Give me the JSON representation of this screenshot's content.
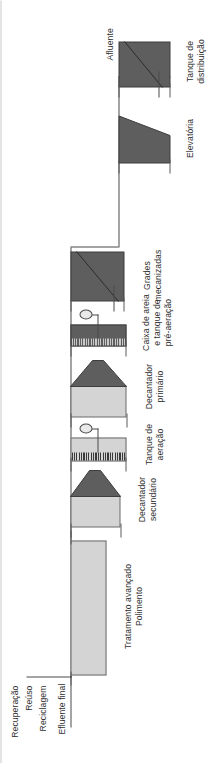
{
  "figure": {
    "kind": "wastewater-treatment-plant-flow-diagram",
    "language": "pt-BR",
    "orientation": "rotated-90-ccw",
    "colors": {
      "line": "#4a4a4a",
      "unit_light": "#d4d4d4",
      "unit_dark": "#5e5e5e",
      "text": "#2f2f2f",
      "background": "#ffffff"
    }
  },
  "endpoints": {
    "inlet_label": "Afluente",
    "outlet_label": "Efluente final"
  },
  "outputs": [
    {
      "label": "Recuperação"
    },
    {
      "label": "Reúso"
    },
    {
      "label": "Reciclagem"
    }
  ],
  "units": [
    {
      "id": "tanque-distribuicao",
      "label_line1": "Tanque de",
      "label_line2": "distribuição",
      "shape": "rectangle-with-diagonal",
      "fill": "dark"
    },
    {
      "id": "elevatoria",
      "label_line1": "Elevatória",
      "label_line2": "",
      "shape": "trapezoid",
      "fill": "dark"
    },
    {
      "id": "grades-mecanizadas",
      "label_line1": "Grades",
      "label_line2": "mecanizadas",
      "shape": "rectangle-with-diagonal",
      "fill": "dark"
    },
    {
      "id": "caixa-areia-pre-aeracao",
      "label_line1": "Caixa de areia",
      "label_line2": "e tanque de",
      "label_line3": "pré-aeração",
      "shape": "hatched-rectangle-with-blower",
      "fill": "dark"
    },
    {
      "id": "decantador-primario",
      "label_line1": "Decantador",
      "label_line2": "primário",
      "shape": "rectangle-with-hopper",
      "fill": "light"
    },
    {
      "id": "tanque-aeracao",
      "label_line1": "Tanque de",
      "label_line2": "aeração",
      "shape": "hatched-rectangle-with-blower",
      "fill": "light"
    },
    {
      "id": "decantador-secundario",
      "label_line1": "Decantador",
      "label_line2": "secundário",
      "shape": "rectangle-with-hopper",
      "fill": "light"
    },
    {
      "id": "tratamento-avancado",
      "label_line1": "Tratamento avançado",
      "label_line2": "Polimento",
      "shape": "rectangle",
      "fill": "light"
    }
  ]
}
